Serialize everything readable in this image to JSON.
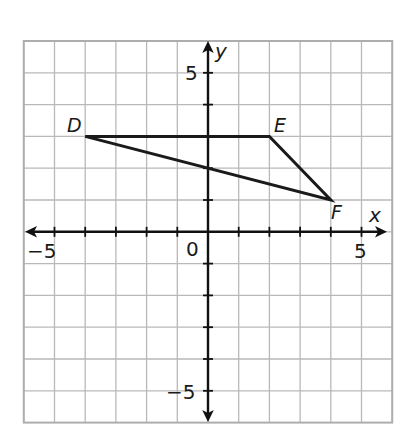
{
  "chart_data": {
    "type": "scatter",
    "title": "",
    "xlabel": "x",
    "ylabel": "y",
    "xlim": [
      -6,
      6
    ],
    "ylim": [
      -6,
      6
    ],
    "grid": true,
    "x_tick_labels": [
      {
        "value": -5,
        "label": "−5"
      },
      {
        "value": 0,
        "label": "0"
      },
      {
        "value": 5,
        "label": "5"
      }
    ],
    "y_tick_labels": [
      {
        "value": 5,
        "label": "5"
      },
      {
        "value": -5,
        "label": "−5"
      }
    ],
    "points": [
      {
        "name": "D",
        "x": -4,
        "y": 3
      },
      {
        "name": "E",
        "x": 2,
        "y": 3
      },
      {
        "name": "F",
        "x": 4,
        "y": 1
      }
    ],
    "polygon": {
      "name": "triangle DEF",
      "vertices": [
        "D",
        "E",
        "F"
      ]
    },
    "legend": null
  },
  "labels": {
    "x_axis": "x",
    "y_axis": "y",
    "origin": "0",
    "x_neg5": "−5",
    "x_pos5": "5",
    "y_pos5": "5",
    "y_neg5": "−5",
    "point_d": "D",
    "point_e": "E",
    "point_f": "F"
  },
  "colors": {
    "grid": "#b9b9b9",
    "axis": "#111111",
    "shape": "#1a1a1a",
    "background": "#ffffff"
  }
}
